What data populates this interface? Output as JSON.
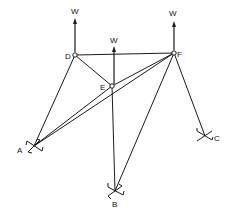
{
  "diagram": {
    "type": "space truss / pin-jointed frame with loads",
    "nodes": [
      {
        "id": "D",
        "label": "D",
        "x": 75,
        "y": 55,
        "kind": "joint"
      },
      {
        "id": "E",
        "label": "E",
        "x": 112,
        "y": 86,
        "kind": "joint"
      },
      {
        "id": "F",
        "label": "F",
        "x": 174,
        "y": 53,
        "kind": "joint"
      },
      {
        "id": "A",
        "label": "A",
        "x": 34,
        "y": 146,
        "kind": "support"
      },
      {
        "id": "B",
        "label": "B",
        "x": 115,
        "y": 191,
        "kind": "support"
      },
      {
        "id": "C",
        "label": "C",
        "x": 205,
        "y": 136,
        "kind": "support"
      }
    ],
    "members": [
      [
        "D",
        "F"
      ],
      [
        "D",
        "E"
      ],
      [
        "D",
        "A"
      ],
      [
        "E",
        "F"
      ],
      [
        "E",
        "A"
      ],
      [
        "E",
        "B"
      ],
      [
        "F",
        "A"
      ],
      [
        "F",
        "B"
      ],
      [
        "F",
        "C"
      ]
    ],
    "loads": [
      {
        "at": "D",
        "label": "W",
        "direction": "up"
      },
      {
        "at": "E",
        "label": "W",
        "direction": "up"
      },
      {
        "at": "F",
        "label": "W",
        "direction": "up"
      }
    ]
  }
}
